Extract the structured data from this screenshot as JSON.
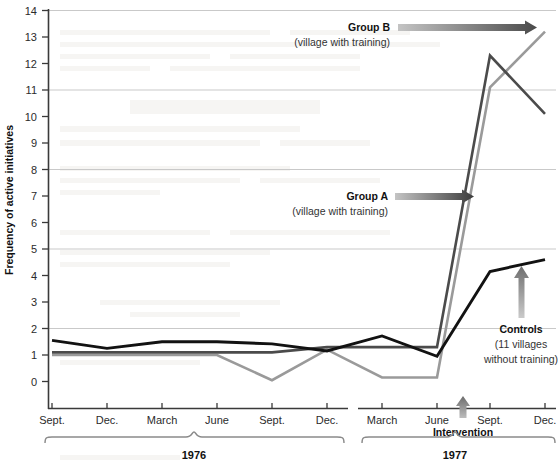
{
  "chart_data": {
    "type": "line",
    "title": "",
    "xlabel": "",
    "ylabel": "Frequency of active initiatives",
    "ylim": [
      0,
      14
    ],
    "yticks": [
      0,
      1,
      2,
      3,
      4,
      5,
      6,
      7,
      8,
      9,
      10,
      11,
      12,
      13,
      14
    ],
    "gridlines": [
      2,
      5,
      8,
      11,
      14
    ],
    "grid": true,
    "legend_position": "inline-annotations",
    "x": [
      "Sept.",
      "Dec.",
      "March",
      "June",
      "Sept.",
      "Dec.",
      "March",
      "June",
      "Sept.",
      "Dec."
    ],
    "x_groups": [
      {
        "label": "1976",
        "ticks": [
          "Sept.",
          "Dec.",
          "March",
          "June",
          "Sept.",
          "Dec."
        ]
      },
      {
        "label": "1977",
        "ticks": [
          "March",
          "June",
          "Sept.",
          "Dec."
        ]
      }
    ],
    "series": [
      {
        "name": "Controls",
        "note": "(11 villages without training)",
        "color": "#121212",
        "values": [
          1.55,
          1.25,
          1.5,
          1.5,
          1.42,
          1.15,
          1.72,
          0.95,
          4.15,
          4.6
        ]
      },
      {
        "name": "Group A",
        "note": "(village with training)",
        "color": "#4b4b4b",
        "values": [
          1.1,
          1.1,
          1.1,
          1.1,
          1.1,
          1.3,
          1.3,
          1.3,
          12.3,
          10.1
        ]
      },
      {
        "name": "Group B",
        "note": "(village with training)",
        "color": "#9a9a9a",
        "values": [
          1.0,
          1.0,
          1.0,
          1.0,
          0.05,
          1.2,
          0.15,
          0.15,
          11.1,
          13.2
        ]
      }
    ],
    "annotations": [
      {
        "id": "group-b",
        "title": "Group B",
        "subtitle": "(village with training)"
      },
      {
        "id": "group-a",
        "title": "Group A",
        "subtitle": "(village with training)"
      },
      {
        "id": "controls",
        "title": "Controls",
        "subtitle_1": "(11 villages",
        "subtitle_2": "without training)"
      },
      {
        "id": "intervention",
        "title": "Intervention"
      }
    ]
  },
  "axis": {
    "y_title": "Frequency of active initiatives",
    "y_tick_labels": [
      "14",
      "13",
      "12",
      "11",
      "10",
      "9",
      "8",
      "7",
      "6",
      "5",
      "4",
      "3",
      "2",
      "1",
      "0"
    ],
    "x_tick_labels": [
      "Sept.",
      "Dec.",
      "March",
      "June",
      "Sept.",
      "Dec.",
      "March",
      "June",
      "Sept.",
      "Dec."
    ]
  },
  "brackets": {
    "left_year": "1976",
    "right_year": "1977"
  },
  "annotations": {
    "group_b_title": "Group B",
    "group_b_sub": "(village with training)",
    "group_a_title": "Group A",
    "group_a_sub": "(village with training)",
    "controls_title": "Controls",
    "controls_sub1": "(11 villages",
    "controls_sub2": "without training)",
    "intervention": "Intervention"
  },
  "colors": {
    "controls": "#121212",
    "group_a": "#4b4b4b",
    "group_b": "#9a9a9a",
    "grid": "#c9c9c9",
    "axis": "#3a3a3a",
    "bracket": "#8a8a8a",
    "background": "#ffffff"
  }
}
